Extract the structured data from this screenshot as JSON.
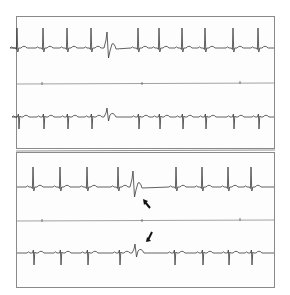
{
  "figure": {
    "colors": {
      "trace": "#3a3a3a",
      "border": "#8a8a8a",
      "arrow": "#111111",
      "background": "#ffffff"
    },
    "panels": [
      {
        "id": "top",
        "strips": [
          {
            "lead": "strip-1",
            "baseline_y": 48,
            "beats": [
              17,
              43,
              67,
              91,
              138,
              159,
              182,
              205,
              233,
              258
            ],
            "premature_beat_x": 107,
            "polarity": "positive"
          },
          {
            "lead": "strip-2",
            "baseline_y": 117,
            "beats": [
              19,
              44,
              68,
              92,
              139,
              160,
              183,
              206,
              234,
              259
            ],
            "premature_beat_x": 107,
            "polarity": "negative"
          }
        ]
      },
      {
        "id": "bottom",
        "strips": [
          {
            "lead": "strip-3",
            "baseline_y": 187,
            "beats": [
              33,
              60,
              87,
              118,
              176,
              202,
              228,
              251
            ],
            "premature_beat_x": 133,
            "polarity": "positive",
            "arrow": {
              "x": 145,
              "y": 202,
              "direction": "up-left"
            }
          },
          {
            "lead": "strip-4",
            "baseline_y": 253,
            "beats": [
              34,
              61,
              88,
              120,
              175,
              203,
              229,
              252
            ],
            "premature_beat_x": 135,
            "polarity": "negative",
            "arrow": {
              "x": 149,
              "y": 238,
              "direction": "down-left"
            }
          }
        ]
      }
    ]
  }
}
